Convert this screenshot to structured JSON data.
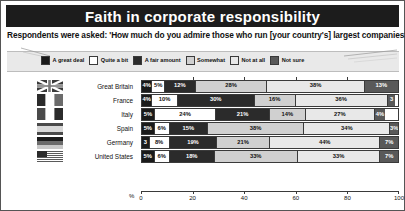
{
  "header": {
    "title": "Faith in corporate responsibility",
    "question": "Respondents were asked: 'How much do you admire those who run [your country's] largest companies?'"
  },
  "colors": {
    "a_great_deal": "#1a1a1a",
    "quite_a_bit": "#ffffff",
    "a_fair_amount": "#2b2b2b",
    "somewhat": "#d0d0d0",
    "not_at_all": "#e8e8e8",
    "not_sure": "#595959",
    "title_bar": "#1c1c1c",
    "legend_band": "#e9e9e9",
    "outline": "#3a3a3a"
  },
  "legend": [
    {
      "label": "A great deal",
      "swatch": "#1a1a1a"
    },
    {
      "label": "Quite a bit",
      "swatch": "#ffffff"
    },
    {
      "label": "A fair amount",
      "swatch": "#2b2b2b"
    },
    {
      "label": "Somewhat",
      "swatch": "#d0d0d0"
    },
    {
      "label": "Not at all",
      "swatch": "#e8e8e8"
    },
    {
      "label": "Not sure",
      "swatch": "#595959"
    }
  ],
  "axis": {
    "unit_label": "%",
    "ticks": [
      "0",
      "20",
      "40",
      "60",
      "80",
      "100"
    ],
    "min": 0,
    "max": 100
  },
  "chart_data": {
    "type": "bar",
    "title": "Faith in corporate responsibility",
    "subtitle": "Respondents were asked: 'How much do you admire those who run [your country's] largest companies?'",
    "orientation": "horizontal",
    "stacked": true,
    "xlabel": "%",
    "ylabel": "",
    "xlim": [
      0,
      100
    ],
    "grid": false,
    "legend_position": "top",
    "categories": [
      "Great Britain",
      "France",
      "Italy",
      "Spain",
      "Germany",
      "United States"
    ],
    "series": [
      {
        "name": "A great deal",
        "values": [
          4,
          4,
          5,
          5,
          3,
          5
        ]
      },
      {
        "name": "Quite a bit",
        "values": [
          5,
          10,
          24,
          6,
          8,
          6
        ]
      },
      {
        "name": "A fair amount",
        "values": [
          12,
          30,
          21,
          15,
          19,
          18
        ]
      },
      {
        "name": "Somewhat",
        "values": [
          28,
          16,
          14,
          38,
          21,
          33
        ]
      },
      {
        "name": "Not at all",
        "values": [
          38,
          36,
          27,
          34,
          44,
          33
        ]
      },
      {
        "name": "Not sure",
        "values": [
          13,
          3,
          4,
          3,
          7,
          7
        ]
      }
    ],
    "rows": [
      {
        "country": "Great Britain",
        "flag": "flag-uk",
        "segments": [
          {
            "label": "A great deal",
            "value": 4,
            "text": "4%"
          },
          {
            "label": "Quite a bit",
            "value": 5,
            "text": "5%"
          },
          {
            "label": "A fair amount",
            "value": 12,
            "text": "12%"
          },
          {
            "label": "Somewhat",
            "value": 28,
            "text": "28%"
          },
          {
            "label": "Not at all",
            "value": 38,
            "text": "38%"
          },
          {
            "label": "Not sure",
            "value": 13,
            "text": "13%"
          }
        ]
      },
      {
        "country": "France",
        "flag": "flag-france",
        "segments": [
          {
            "label": "A great deal",
            "value": 4,
            "text": "4%"
          },
          {
            "label": "Quite a bit",
            "value": 10,
            "text": "10%"
          },
          {
            "label": "A fair amount",
            "value": 30,
            "text": "30%"
          },
          {
            "label": "Somewhat",
            "value": 16,
            "text": "16%"
          },
          {
            "label": "Not at all",
            "value": 36,
            "text": "36%"
          },
          {
            "label": "Not sure",
            "value": 3,
            "text": "3"
          }
        ]
      },
      {
        "country": "Italy",
        "flag": "flag-italy",
        "segments": [
          {
            "label": "A great deal",
            "value": 5,
            "text": "5%"
          },
          {
            "label": "Quite a bit",
            "value": 24,
            "text": "24%"
          },
          {
            "label": "A fair amount",
            "value": 21,
            "text": "21%"
          },
          {
            "label": "Somewhat",
            "value": 14,
            "text": "14%"
          },
          {
            "label": "Not at all",
            "value": 27,
            "text": "27%"
          },
          {
            "label": "Not sure",
            "value": 4,
            "text": "4%"
          }
        ]
      },
      {
        "country": "Spain",
        "flag": "flag-spain",
        "segments": [
          {
            "label": "A great deal",
            "value": 5,
            "text": "5%"
          },
          {
            "label": "Quite a bit",
            "value": 6,
            "text": "6%"
          },
          {
            "label": "A fair amount",
            "value": 15,
            "text": "15%"
          },
          {
            "label": "Somewhat",
            "value": 38,
            "text": "38%"
          },
          {
            "label": "Not at all",
            "value": 34,
            "text": "34%"
          },
          {
            "label": "Not sure",
            "value": 3,
            "text": "3%"
          }
        ]
      },
      {
        "country": "Germany",
        "flag": "flag-germany",
        "segments": [
          {
            "label": "A great deal",
            "value": 3,
            "text": "3"
          },
          {
            "label": "Quite a bit",
            "value": 8,
            "text": "8%"
          },
          {
            "label": "A fair amount",
            "value": 19,
            "text": "19%"
          },
          {
            "label": "Somewhat",
            "value": 21,
            "text": "21%"
          },
          {
            "label": "Not at all",
            "value": 44,
            "text": "44%"
          },
          {
            "label": "Not sure",
            "value": 7,
            "text": "7%"
          }
        ]
      },
      {
        "country": "United States",
        "flag": "flag-usa",
        "segments": [
          {
            "label": "A great deal",
            "value": 5,
            "text": "5%"
          },
          {
            "label": "Quite a bit",
            "value": 6,
            "text": "6%"
          },
          {
            "label": "A fair amount",
            "value": 18,
            "text": "18%"
          },
          {
            "label": "Somewhat",
            "value": 33,
            "text": "33%"
          },
          {
            "label": "Not at all",
            "value": 33,
            "text": "33%"
          },
          {
            "label": "Not sure",
            "value": 7,
            "text": "7%"
          }
        ]
      }
    ]
  }
}
